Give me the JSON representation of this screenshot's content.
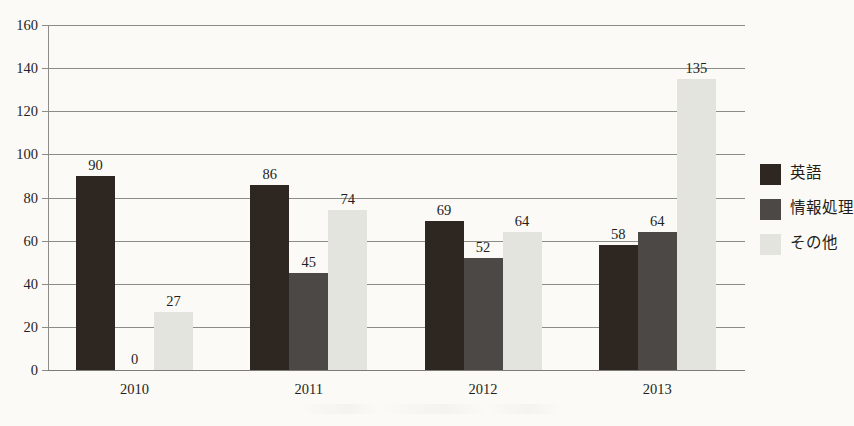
{
  "chart_data": {
    "type": "bar",
    "title": "",
    "xlabel": "",
    "ylabel": "",
    "categories": [
      "2010",
      "2011",
      "2012",
      "2013"
    ],
    "series": [
      {
        "name": "英語",
        "color": "#2e2621",
        "values": [
          90,
          86,
          69,
          58
        ]
      },
      {
        "name": "情報処理",
        "color": "#4b4846",
        "values": [
          0,
          45,
          52,
          64
        ]
      },
      {
        "name": "その他",
        "color": "#e4e4df",
        "values": [
          27,
          74,
          64,
          135
        ]
      }
    ],
    "ylim": [
      0,
      160
    ],
    "ytick_step": 20,
    "yticks": [
      "160",
      "140",
      "120",
      "100",
      "80",
      "60",
      "40",
      "20",
      "0"
    ],
    "grid": true,
    "legend_position": "right",
    "data_labels": true
  },
  "legend": {
    "items": [
      {
        "label": "英語"
      },
      {
        "label": "情報処理"
      },
      {
        "label": "その他"
      }
    ]
  },
  "axes": {
    "y_tick_labels": [
      "160",
      "140",
      "120",
      "100",
      "80",
      "60",
      "40",
      "20",
      "0"
    ],
    "x_tick_labels": [
      "2010",
      "2011",
      "2012",
      "2013"
    ]
  }
}
